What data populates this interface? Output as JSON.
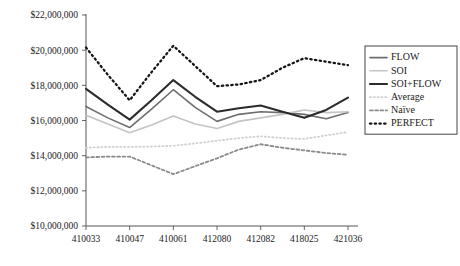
{
  "chart_data": {
    "type": "line",
    "title": "",
    "subtitle": "",
    "xlabel": "",
    "ylabel": "",
    "grid": false,
    "legend_position": "right",
    "ylim": [
      10000000,
      22000000
    ],
    "ytick_values": [
      10000000,
      12000000,
      14000000,
      16000000,
      18000000,
      20000000,
      22000000
    ],
    "ytick_labels": [
      "$10,000,000",
      "$12,000,000",
      "$14,000,000",
      "$16,000,000",
      "$18,000,000",
      "$20,000,000",
      "$22,000,000"
    ],
    "categories": [
      "410033",
      "410040",
      "410047",
      "410054",
      "410061",
      "412073",
      "412080",
      "412081",
      "412082",
      "418018",
      "418025",
      "421029",
      "421036"
    ],
    "xtick_labels": [
      "410033",
      "410047",
      "410061",
      "412080",
      "412082",
      "418025",
      "421036"
    ],
    "xtick_indices": [
      0,
      2,
      4,
      6,
      8,
      10,
      12
    ],
    "series": [
      {
        "name": "FLOW",
        "color": "#6e6e6e",
        "style": "solid",
        "width": 1.6,
        "values": [
          16800000,
          16150000,
          15600000,
          16650000,
          17750000,
          16750000,
          15950000,
          16350000,
          16500000,
          16450000,
          16350000,
          16100000,
          16450000
        ]
      },
      {
        "name": "SOI",
        "color": "#c4c4c4",
        "style": "solid",
        "width": 1.6,
        "values": [
          16300000,
          15800000,
          15300000,
          15750000,
          16250000,
          15800000,
          15550000,
          15950000,
          16150000,
          16350000,
          16600000,
          16450000,
          16500000
        ]
      },
      {
        "name": "SOI+FLOW",
        "color": "#2b2b2b",
        "style": "solid",
        "width": 2.1,
        "values": [
          17800000,
          16900000,
          16050000,
          17150000,
          18300000,
          17350000,
          16500000,
          16700000,
          16850000,
          16500000,
          16150000,
          16600000,
          17300000
        ]
      },
      {
        "name": "Average",
        "color": "#d0d0d0",
        "style": "dotted",
        "width": 1.8,
        "values": [
          14450000,
          14500000,
          14500000,
          14520000,
          14560000,
          14700000,
          14850000,
          15000000,
          15100000,
          15000000,
          14950000,
          15150000,
          15350000
        ]
      },
      {
        "name": "Naïve",
        "color": "#8a8a8a",
        "style": "dashed",
        "width": 1.8,
        "values": [
          13900000,
          13950000,
          13950000,
          13450000,
          12950000,
          13400000,
          13850000,
          14350000,
          14650000,
          14450000,
          14300000,
          14150000,
          14050000
        ]
      },
      {
        "name": "PERFECT",
        "color": "#151515",
        "style": "bold-dotted",
        "width": 2.3,
        "values": [
          20150000,
          18600000,
          17150000,
          18750000,
          20250000,
          19100000,
          17950000,
          18050000,
          18300000,
          19000000,
          19550000,
          19350000,
          19150000
        ]
      }
    ],
    "legend_entries": [
      "FLOW",
      "SOI",
      "SOI+FLOW",
      "Average",
      "Naïve",
      "PERFECT"
    ]
  }
}
